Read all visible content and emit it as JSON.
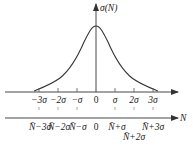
{
  "diagram": {
    "type": "normal-distribution-curve",
    "y_axis_label": "σ(N)",
    "x_axis_label": "N",
    "upper_axis_ticks": [
      "−3σ",
      "−2σ",
      "−σ",
      "0",
      "σ",
      "2σ",
      "3σ"
    ],
    "lower_axis_ticks": [
      "N̄−3σ",
      "N̄−2σ",
      "N̄−σ",
      "0",
      "N̄+σ",
      "N̄+2σ",
      "N̄+3σ"
    ],
    "colors": {
      "line": "#333333",
      "text": "#222222",
      "background": "#ffffff"
    }
  }
}
